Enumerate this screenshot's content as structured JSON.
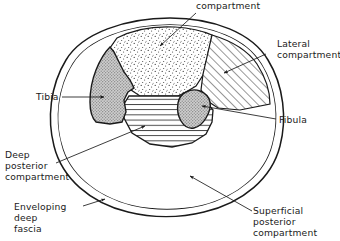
{
  "figure": {
    "type": "anatomical-cross-section",
    "colors": {
      "ink": "#1a1a1a",
      "bone_fill": "#b4b4b4",
      "anterior_stipple": "#333333",
      "page_background": "#ffffff"
    }
  },
  "labels": {
    "anterior": {
      "lines": [
        "compartment"
      ],
      "line1": "compartment"
    },
    "lateral": {
      "lines": [
        "Lateral",
        "compartment"
      ],
      "line1": "Lateral",
      "line2": "compartment"
    },
    "tibia": {
      "lines": [
        "Tibia"
      ],
      "line1": "Tibia"
    },
    "fibula": {
      "lines": [
        "Fibula"
      ],
      "line1": "Fibula"
    },
    "deep_posterior": {
      "lines": [
        "Deep",
        "posterior",
        "compartment"
      ],
      "line1": "Deep",
      "line2": "posterior",
      "line3": "compartment"
    },
    "enveloping_fascia": {
      "lines": [
        "Enveloping",
        "deep",
        "fascia"
      ],
      "line1": "Enveloping",
      "line2": "deep",
      "line3": "fascia"
    },
    "superficial_posterior": {
      "lines": [
        "Superficial",
        "posterior",
        "compartment"
      ],
      "line1": "Superficial",
      "line2": "posterior",
      "line3": "compartment"
    }
  },
  "regions": {
    "anterior_compartment": {
      "fill_style": "stipple"
    },
    "lateral_compartment": {
      "fill_style": "diagonal-hatch"
    },
    "deep_posterior_compartment": {
      "fill_style": "horizontal-hatch"
    },
    "superficial_posterior_compartment": {
      "fill_style": "blank"
    },
    "tibia_bone": {
      "fill_style": "gray-stipple"
    },
    "fibula_bone": {
      "fill_style": "gray-stipple"
    },
    "enveloping_deep_fascia": {
      "fill_style": "double-outline"
    }
  }
}
